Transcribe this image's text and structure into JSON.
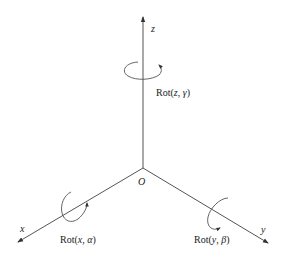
{
  "diagram": {
    "origin": {
      "label": "O",
      "x": 143,
      "y": 168
    },
    "axes": [
      {
        "name": "z",
        "label": "z",
        "end": [
          143,
          16
        ]
      },
      {
        "name": "x",
        "label": "x",
        "end": [
          17,
          242
        ]
      },
      {
        "name": "y",
        "label": "y",
        "end": [
          268,
          243
        ]
      }
    ],
    "rotations": {
      "z": {
        "prefix": "Rot(",
        "axis": "z",
        "sep": ", ",
        "angle": "γ",
        "suffix": ")"
      },
      "x": {
        "prefix": "Rot(",
        "axis": "x",
        "sep": ", ",
        "angle": "α",
        "suffix": ")"
      },
      "y": {
        "prefix": "Rot(",
        "axis": "y",
        "sep": ", ",
        "angle": "β",
        "suffix": ")"
      }
    },
    "colors": {
      "line": "#555555",
      "text": "#222222",
      "background": "#ffffff"
    }
  }
}
